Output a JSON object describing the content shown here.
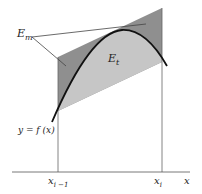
{
  "labels": {
    "em_main": "E",
    "em_sub": "m",
    "et_main": "E",
    "et_sub": "t",
    "func": "y = f (x)",
    "x_left_main": "x",
    "x_left_sub": "i −1",
    "x_right_main": "x",
    "x_right_sub": "i",
    "x_axis": "x"
  },
  "colors": {
    "dark_shade": "#8f8f8f",
    "light_shade": "#c4c4c4",
    "curve": "#111111",
    "lines": "#555555"
  }
}
